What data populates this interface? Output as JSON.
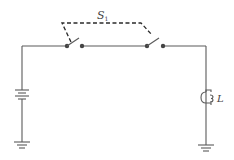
{
  "diagram": {
    "type": "circuit-schematic",
    "labels": {
      "switch_main": "S",
      "switch_sub": "1",
      "lamp": "L"
    },
    "components": [
      {
        "id": "battery",
        "kind": "battery",
        "position": "left branch"
      },
      {
        "id": "switch-s1-a",
        "kind": "switch",
        "position": "top wire left",
        "state": "open",
        "ganged_with": "switch-s1-b"
      },
      {
        "id": "switch-s1-b",
        "kind": "switch",
        "position": "top wire right",
        "state": "open",
        "ganged_with": "switch-s1-a"
      },
      {
        "id": "lamp",
        "kind": "lamp",
        "label": "L",
        "position": "right branch"
      },
      {
        "id": "ground-left",
        "kind": "ground",
        "position": "bottom left"
      },
      {
        "id": "ground-right",
        "kind": "ground",
        "position": "bottom right"
      }
    ],
    "colors": {
      "wire": "#5a5a5a",
      "dashed_link": "#2a2a2a",
      "background": "#ffffff"
    }
  }
}
